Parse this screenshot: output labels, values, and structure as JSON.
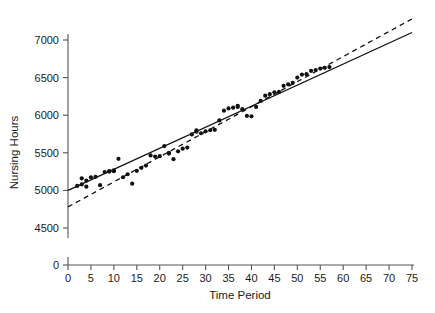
{
  "chart_data": {
    "type": "scatter",
    "title": "",
    "xlabel": "Time Period",
    "ylabel": "Nursing Hours",
    "xlim": [
      0,
      75
    ],
    "ylim": [
      4350,
      7150
    ],
    "y_axis_break": true,
    "y_zero_label": "0",
    "grid": false,
    "legend": null,
    "xticks": [
      0,
      5,
      10,
      15,
      20,
      25,
      30,
      35,
      40,
      45,
      50,
      55,
      60,
      65,
      70,
      75
    ],
    "xtick_labels": [
      "0",
      "5",
      "10",
      "15",
      "20",
      "25",
      "30",
      "35",
      "40",
      "45",
      "50",
      "55",
      "60",
      "65",
      "70",
      "75"
    ],
    "yticks": [
      4500,
      5000,
      5500,
      6000,
      6500,
      7000
    ],
    "ytick_labels": [
      "4500",
      "5000",
      "5500",
      "6000",
      "6500",
      "7000"
    ],
    "series": [
      {
        "name": "Observed nursing hours",
        "type": "scatter",
        "marker": "filled-circle",
        "color": "#111111",
        "points": [
          [
            2,
            5060
          ],
          [
            3,
            5080
          ],
          [
            3,
            5160
          ],
          [
            4,
            5050
          ],
          [
            4,
            5130
          ],
          [
            5,
            5175
          ],
          [
            6,
            5180
          ],
          [
            7,
            5070
          ],
          [
            8,
            5245
          ],
          [
            9,
            5250
          ],
          [
            9,
            5255
          ],
          [
            10,
            5255
          ],
          [
            10,
            5265
          ],
          [
            11,
            5420
          ],
          [
            12,
            5175
          ],
          [
            13,
            5215
          ],
          [
            14,
            5090
          ],
          [
            15,
            5260
          ],
          [
            16,
            5300
          ],
          [
            17,
            5330
          ],
          [
            18,
            5465
          ],
          [
            19,
            5450
          ],
          [
            20,
            5455
          ],
          [
            21,
            5590
          ],
          [
            22,
            5490
          ],
          [
            22,
            5500
          ],
          [
            23,
            5415
          ],
          [
            24,
            5520
          ],
          [
            25,
            5555
          ],
          [
            26,
            5570
          ],
          [
            27,
            5745
          ],
          [
            28,
            5780
          ],
          [
            28,
            5800
          ],
          [
            29,
            5760
          ],
          [
            30,
            5785
          ],
          [
            31,
            5800
          ],
          [
            32,
            5805
          ],
          [
            33,
            5930
          ],
          [
            34,
            6060
          ],
          [
            35,
            6090
          ],
          [
            36,
            6100
          ],
          [
            37,
            6110
          ],
          [
            37,
            6125
          ],
          [
            38,
            6080
          ],
          [
            39,
            5990
          ],
          [
            40,
            5985
          ],
          [
            41,
            6110
          ],
          [
            42,
            6190
          ],
          [
            43,
            6260
          ],
          [
            44,
            6280
          ],
          [
            45,
            6305
          ],
          [
            46,
            6310
          ],
          [
            47,
            6390
          ],
          [
            48,
            6410
          ],
          [
            49,
            6430
          ],
          [
            50,
            6500
          ],
          [
            51,
            6540
          ],
          [
            52,
            6545
          ],
          [
            53,
            6590
          ],
          [
            54,
            6600
          ],
          [
            55,
            6620
          ],
          [
            56,
            6630
          ],
          [
            57,
            6640
          ]
        ]
      },
      {
        "name": "Fitted regression line",
        "type": "line",
        "style": "solid",
        "color": "#111111",
        "endpoints": [
          [
            0,
            5000
          ],
          [
            75,
            7100
          ]
        ]
      },
      {
        "name": "Reference trend line",
        "type": "line",
        "style": "dashed",
        "color": "#111111",
        "endpoints": [
          [
            0,
            4780
          ],
          [
            75,
            7280
          ]
        ]
      }
    ]
  },
  "figure": {
    "background_color": "#ffffff",
    "axis_color": "#555555",
    "data_color": "#111111"
  }
}
